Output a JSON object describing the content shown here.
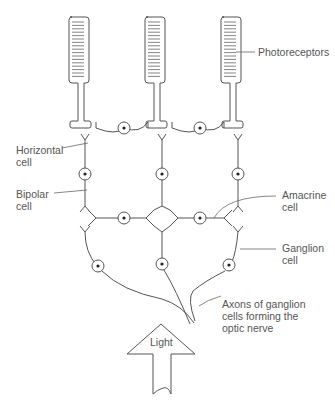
{
  "diagram": {
    "labels": {
      "photoreceptors": "Photoreceptors",
      "horizontal": [
        "Horizontal",
        "cell"
      ],
      "bipolar": [
        "Bipolar",
        "cell"
      ],
      "amacrine": [
        "Amacrine",
        "cell"
      ],
      "ganglion": [
        "Ganglion",
        "cell"
      ],
      "axons": [
        "Axons of ganglion",
        "cells forming the",
        "optic nerve"
      ],
      "light": "Light"
    },
    "columns": 3,
    "colors": {
      "line": "#555555",
      "text": "#555555",
      "background": "#ffffff"
    }
  }
}
